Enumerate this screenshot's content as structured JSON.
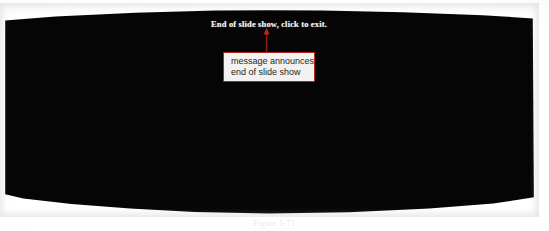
{
  "page": {
    "background_color": "#ffffff",
    "caption": "Figure 1-71"
  },
  "slide": {
    "background_color": "#050505",
    "message": "End of slide show, click to exit.",
    "message_color": "#f2f2f2"
  },
  "annotation": {
    "border_color": "#b5231f",
    "fill_color": "#f4f2f0",
    "text_color": "#262626",
    "lines": [
      "message announces",
      "end of slide show"
    ],
    "arrow": {
      "color": "#8f1b18",
      "direction": "up",
      "name": "annotation-arrow"
    }
  }
}
